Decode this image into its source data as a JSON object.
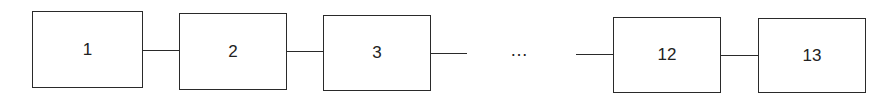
{
  "diagram": {
    "type": "linear-chain",
    "nodes": [
      {
        "label": "1"
      },
      {
        "label": "2"
      },
      {
        "label": "3"
      },
      {
        "label": "12"
      },
      {
        "label": "13"
      }
    ],
    "ellipsis": "…",
    "colors": {
      "stroke": "#2a2a2a",
      "background": "#ffffff",
      "text": "#222222"
    }
  }
}
